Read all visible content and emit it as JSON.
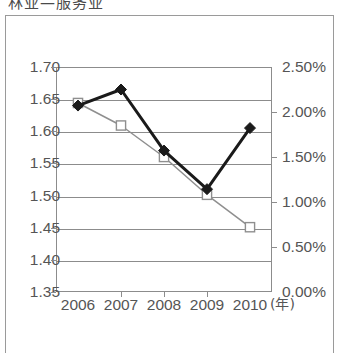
{
  "caption": {
    "text": "林业—服务业"
  },
  "chart_data": {
    "type": "line",
    "title": "",
    "subtitle": "",
    "xlabel": "(年)",
    "x_unit_label": "(年)",
    "categories": [
      "2006",
      "2007",
      "2008",
      "2009",
      "2010"
    ],
    "x": [
      2006,
      2007,
      2008,
      2009,
      2010
    ],
    "grid": true,
    "legend_position": "none",
    "axes": {
      "left": {
        "ylabel": "",
        "ylim": [
          1.35,
          1.7
        ],
        "tick_step": 0.05,
        "ticks": [
          "1.70",
          "1.65",
          "1.60",
          "1.55",
          "1.50",
          "1.45",
          "1.40",
          "1.35"
        ],
        "tick_values": [
          1.7,
          1.65,
          1.6,
          1.55,
          1.5,
          1.45,
          1.4,
          1.35
        ]
      },
      "right": {
        "ylabel": "",
        "ylim": [
          0.0,
          2.5
        ],
        "tick_step": 0.5,
        "ticks": [
          "2.50%",
          "2.00%",
          "1.50%",
          "1.00%",
          "0.50%",
          "0.00%"
        ],
        "tick_values": [
          2.5,
          2.0,
          1.5,
          1.0,
          0.5,
          0.0
        ]
      }
    },
    "series": [
      {
        "name": "series-diamond",
        "axis": "left",
        "marker": "filled-diamond",
        "color": "#1a1a1a",
        "line_width": 3,
        "values": [
          1.64,
          1.665,
          1.57,
          1.51,
          1.605
        ]
      },
      {
        "name": "series-square",
        "axis": "right",
        "marker": "open-square",
        "color": "#8f8f8f",
        "line_width": 1.5,
        "values": [
          2.1,
          1.85,
          1.5,
          1.08,
          0.72
        ]
      }
    ]
  },
  "colors": {
    "frame": "#9a9a9a",
    "plot_border": "#8c8c8c",
    "gridline": "#8c8c8c",
    "tick_text": "#555555",
    "series_primary": "#1a1a1a",
    "series_secondary": "#8f8f8f",
    "background": "#ffffff"
  }
}
